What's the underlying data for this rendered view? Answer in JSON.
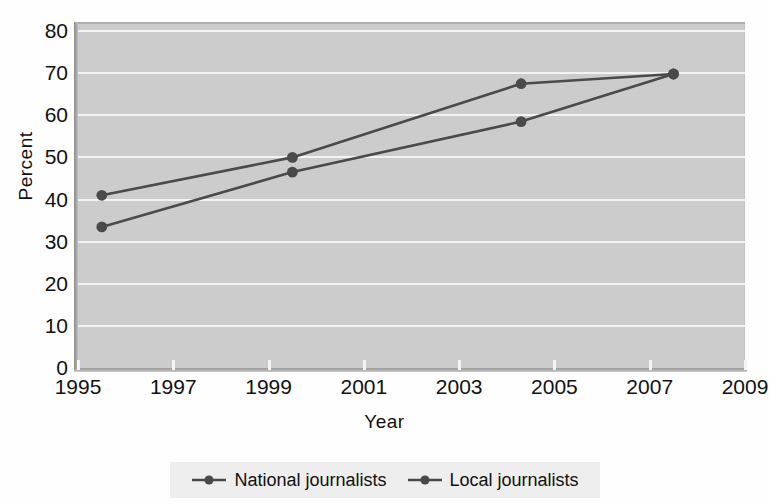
{
  "chart_data": {
    "type": "line",
    "title": "",
    "xlabel": "Year",
    "ylabel": "Percent",
    "xlim": [
      1995,
      2009
    ],
    "ylim": [
      0,
      80
    ],
    "grid": true,
    "legend_position": "bottom",
    "x_ticks": [
      "1995",
      "1997",
      "1999",
      "2001",
      "2003",
      "2005",
      "2007",
      "2009"
    ],
    "x_tick_values": [
      1995,
      1997,
      1999,
      2001,
      2003,
      2005,
      2007,
      2009
    ],
    "y_ticks": [
      "80",
      "70",
      "60",
      "50",
      "40",
      "30",
      "20",
      "10",
      "0"
    ],
    "y_tick_values": [
      80,
      70,
      60,
      50,
      40,
      30,
      20,
      10,
      0
    ],
    "series": [
      {
        "name": "National journalists",
        "color": "#4a4a4a",
        "marker": "circle",
        "x": [
          1995.5,
          1999.5,
          2004.3,
          2007.5
        ],
        "values": [
          41,
          50,
          67.5,
          69.8
        ]
      },
      {
        "name": "Local journalists",
        "color": "#4a4a4a",
        "marker": "circle",
        "x": [
          1995.5,
          1999.5,
          2004.3,
          2007.5
        ],
        "values": [
          33.5,
          46.5,
          58.5,
          69.8
        ]
      }
    ]
  },
  "axes": {
    "y_label": "Percent",
    "x_label": "Year"
  },
  "legend": {
    "entries": [
      {
        "label": "National journalists"
      },
      {
        "label": "Local journalists"
      }
    ]
  },
  "title_sliver": "",
  "colors": {
    "plot_background": "#c9c9c9",
    "gridline": "#f2f2f2",
    "series_line": "#4a4a4a",
    "legend_background": "#eeeeee",
    "text": "#111111"
  }
}
